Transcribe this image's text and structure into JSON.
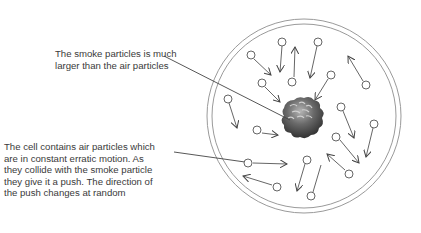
{
  "diagram": {
    "labels": {
      "smoke_particle": "The smoke particles is much larger than the air particles",
      "air_particles": "The cell contains air particles which are in constant erratic motion. As they collide with the smoke particle they give it a push. The direction of the push changes at random"
    },
    "cell": {
      "cx": 304,
      "cy": 116,
      "outer_r": 97,
      "inner_r": 92
    },
    "smoke_particle": {
      "cx": 300,
      "cy": 118,
      "r": 19
    },
    "colors": {
      "text": "#3a3a3a",
      "lines": "#444444",
      "cell_border": "#9a9a9a",
      "smoke_dark": "#2f2f2f",
      "smoke_light": "#9a9a9a"
    }
  }
}
